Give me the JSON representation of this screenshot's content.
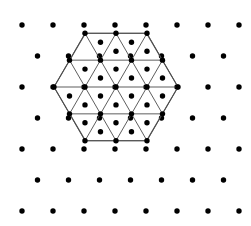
{
  "figure": {
    "width": 251,
    "height": 226,
    "background_color": "#ffffff"
  },
  "chart_data": {
    "type": "scatter",
    "subtitle": "",
    "xlabel": "",
    "ylabel": "",
    "grid": false,
    "legend": null,
    "xlim": [
      0,
      251
    ],
    "ylim": [
      0,
      226
    ],
    "lattice": {
      "spacing_x": 31,
      "spacing_y": 31,
      "origin_x": 22,
      "origin_y": 25,
      "row_offset_x": 15.5,
      "dot_radius": 2.7,
      "dot_color": "#000000",
      "row_counts": [
        8,
        7,
        8,
        7,
        8,
        7,
        8
      ],
      "total_dots": 53,
      "rows": [
        {
          "index": 0,
          "y": 25,
          "start_x": 22,
          "count": 8
        },
        {
          "index": 1,
          "y": 56,
          "start_x": 37.5,
          "count": 7
        },
        {
          "index": 2,
          "y": 87,
          "start_x": 22,
          "count": 8
        },
        {
          "index": 3,
          "y": 118,
          "start_x": 37.5,
          "count": 7
        },
        {
          "index": 4,
          "y": 149,
          "start_x": 22,
          "count": 8
        },
        {
          "index": 5,
          "y": 180,
          "start_x": 37.5,
          "count": 7
        },
        {
          "index": 6,
          "y": 211,
          "start_x": 22,
          "count": 8
        }
      ]
    },
    "hexagon": {
      "center_x": 116,
      "center_y": 87,
      "circumradius": 62,
      "orientation": "flat-top",
      "subdivisions": 2,
      "edge_color": "#4d4d4d",
      "edge_width": 1.1,
      "internal_edge_color": "#555555",
      "internal_edge_width": 0.95,
      "triangle_count": 24,
      "vertex_count": 19,
      "centroid_dot_count": 24,
      "centroid_dot_radius": 2.7,
      "vertices": [
        {
          "x": 85.5,
          "y": 33.3
        },
        {
          "x": 146.5,
          "y": 33.3
        },
        {
          "x": 178,
          "y": 87
        },
        {
          "x": 146.5,
          "y": 140.7
        },
        {
          "x": 85.5,
          "y": 140.7
        },
        {
          "x": 54,
          "y": 87
        }
      ]
    }
  }
}
